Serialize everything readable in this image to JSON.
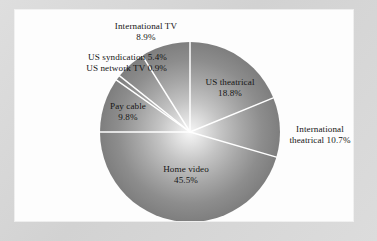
{
  "figure": {
    "background_color": "#d9d9d9",
    "panel_color": "#fdfdfd",
    "slice_line_color": "#ffffff",
    "pie_edge_color": "#808080",
    "pie_center_color": "#f2f2f2"
  },
  "chart_data": {
    "type": "pie",
    "title": "",
    "subtitle": "",
    "xlabel": "",
    "ylabel": "",
    "legend_position": "none",
    "grid": false,
    "units": "percent",
    "total": 100.0,
    "categories": [
      "US theatrical",
      "International theatrical",
      "Home video",
      "Pay cable",
      "US network TV",
      "US syndication",
      "International TV"
    ],
    "values": [
      18.8,
      10.7,
      45.5,
      9.8,
      0.9,
      5.4,
      8.9
    ],
    "slices": [
      {
        "name": "US theatrical",
        "value": 18.8,
        "value_label": "18.8%",
        "label_placement": "inside",
        "label_lines": [
          "US theatrical",
          "18.8%"
        ]
      },
      {
        "name": "International theatrical",
        "value": 10.7,
        "value_label": "10.7%",
        "label_placement": "outside-right",
        "label_lines": [
          "International",
          "theatrical 10.7%"
        ]
      },
      {
        "name": "Home video",
        "value": 45.5,
        "value_label": "45.5%",
        "label_placement": "inside",
        "label_lines": [
          "Home video",
          "45.5%"
        ]
      },
      {
        "name": "Pay cable",
        "value": 9.8,
        "value_label": "9.8%",
        "label_placement": "inside",
        "label_lines": [
          "Pay cable",
          "9.8%"
        ]
      },
      {
        "name": "US network TV",
        "value": 0.9,
        "value_label": "0.9%",
        "label_placement": "outside-left",
        "label_lines": [
          "US network TV 0.9%"
        ]
      },
      {
        "name": "US syndication",
        "value": 5.4,
        "value_label": "5.4%",
        "label_placement": "outside-left",
        "label_lines": [
          "US syndication 5.4%"
        ]
      },
      {
        "name": "International TV",
        "value": 8.9,
        "value_label": "8.9%",
        "label_placement": "outside-top",
        "label_lines": [
          "International TV",
          "8.9%"
        ]
      }
    ]
  },
  "labels": {
    "international_tv_name": "International TV",
    "international_tv_value": "8.9%",
    "us_syndication_line": "US syndication 5.4%",
    "us_network_tv_line": "US network TV 0.9%",
    "pay_cable_name": "Pay cable",
    "pay_cable_value": "9.8%",
    "us_theatrical_name": "US theatrical",
    "us_theatrical_value": "18.8%",
    "international_theatrical_line1": "International",
    "international_theatrical_line2": "theatrical 10.7%",
    "home_video_name": "Home video",
    "home_video_value": "45.5%"
  }
}
